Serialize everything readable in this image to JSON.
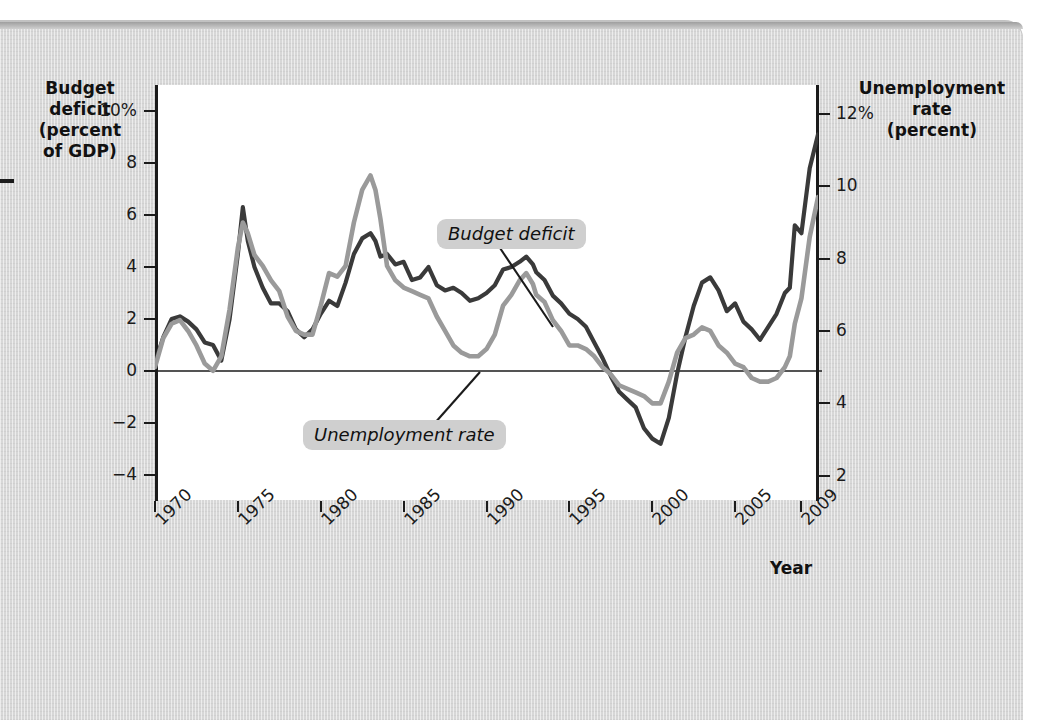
{
  "figure": {
    "background_color": "#d7d7d7",
    "plot_background": "#ffffff"
  },
  "axes": {
    "left_title": "Budget deficit (percent of GDP)",
    "left_title_lines": [
      "Budget",
      "deficit",
      "(percent",
      "of GDP)"
    ],
    "right_title": "Unemployment rate (percent)",
    "right_title_lines": [
      "Unemployment",
      "rate",
      "(percent)"
    ],
    "x_title": "Year",
    "left_ticks": [
      "10%",
      "8",
      "6",
      "4",
      "2",
      "0",
      "−2",
      "−4"
    ],
    "left_tick_values": [
      10,
      8,
      6,
      4,
      2,
      0,
      -2,
      -4
    ],
    "right_ticks": [
      "12%",
      "10",
      "8",
      "6",
      "4",
      "2"
    ],
    "right_tick_values": [
      12,
      10,
      8,
      6,
      4,
      2
    ],
    "x_ticks": [
      "1970",
      "1975",
      "1980",
      "1985",
      "1990",
      "1995",
      "2000",
      "2005",
      "2009"
    ],
    "x_tick_values": [
      1970,
      1975,
      1980,
      1985,
      1990,
      1995,
      2000,
      2005,
      2009
    ]
  },
  "callouts": {
    "budget_deficit": "Budget deficit",
    "unemployment_rate": "Unemployment rate"
  },
  "chart_data": {
    "type": "line",
    "title": "",
    "xlabel": "Year",
    "grid": false,
    "legend": "annotated-callouts",
    "xlim": [
      1970,
      2010
    ],
    "axes": [
      {
        "name": "left",
        "label": "Budget deficit (percent of GDP)",
        "ylim": [
          -5,
          11
        ],
        "ticks": [
          -4,
          -2,
          0,
          2,
          4,
          6,
          8,
          10
        ]
      },
      {
        "name": "right",
        "label": "Unemployment rate (percent)",
        "ylim": [
          1.3,
          12.8
        ],
        "ticks": [
          2,
          4,
          6,
          8,
          10,
          12
        ]
      }
    ],
    "zero_line": 0,
    "series": [
      {
        "name": "Budget deficit",
        "axis": "left",
        "color": "#3a3a3a",
        "units": "percent of GDP",
        "x": [
          1970.0,
          1970.5,
          1971.0,
          1971.5,
          1972.0,
          1972.5,
          1973.0,
          1973.5,
          1974.0,
          1974.5,
          1975.0,
          1975.3,
          1975.6,
          1976.0,
          1976.5,
          1977.0,
          1977.5,
          1978.0,
          1978.5,
          1979.0,
          1979.5,
          1980.0,
          1980.5,
          1981.0,
          1981.5,
          1982.0,
          1982.5,
          1983.0,
          1983.3,
          1983.6,
          1984.0,
          1984.5,
          1985.0,
          1985.5,
          1986.0,
          1986.5,
          1987.0,
          1987.5,
          1988.0,
          1988.5,
          1989.0,
          1989.5,
          1990.0,
          1990.5,
          1991.0,
          1991.5,
          1992.0,
          1992.4,
          1992.8,
          1993.0,
          1993.5,
          1994.0,
          1994.5,
          1995.0,
          1995.5,
          1996.0,
          1996.5,
          1997.0,
          1997.5,
          1998.0,
          1998.5,
          1999.0,
          1999.5,
          2000.0,
          2000.5,
          2001.0,
          2001.5,
          2002.0,
          2002.5,
          2003.0,
          2003.5,
          2004.0,
          2004.5,
          2005.0,
          2005.5,
          2006.0,
          2006.5,
          2007.0,
          2007.5,
          2008.0,
          2008.3,
          2008.6,
          2009.0,
          2009.5,
          2010.0
        ],
        "y": [
          0.3,
          1.3,
          2.0,
          2.1,
          1.9,
          1.6,
          1.1,
          1.0,
          0.4,
          2.0,
          4.5,
          6.3,
          5.0,
          4.0,
          3.2,
          2.6,
          2.6,
          2.3,
          1.6,
          1.3,
          1.6,
          2.2,
          2.7,
          2.5,
          3.4,
          4.5,
          5.1,
          5.3,
          5.0,
          4.4,
          4.5,
          4.1,
          4.2,
          3.5,
          3.6,
          4.0,
          3.3,
          3.1,
          3.2,
          3.0,
          2.7,
          2.8,
          3.0,
          3.3,
          3.9,
          4.0,
          4.2,
          4.4,
          4.1,
          3.8,
          3.5,
          2.9,
          2.6,
          2.2,
          2.0,
          1.7,
          1.1,
          0.5,
          -0.2,
          -0.8,
          -1.1,
          -1.4,
          -2.2,
          -2.6,
          -2.8,
          -1.8,
          -0.1,
          1.3,
          2.5,
          3.4,
          3.6,
          3.1,
          2.3,
          2.6,
          1.9,
          1.6,
          1.2,
          1.7,
          2.2,
          3.0,
          3.2,
          5.6,
          5.3,
          7.8,
          9.1
        ]
      },
      {
        "name": "Unemployment rate",
        "axis": "right",
        "color": "#9a9a9a",
        "units": "percent",
        "x": [
          1970.0,
          1970.5,
          1971.0,
          1971.5,
          1972.0,
          1972.5,
          1973.0,
          1973.5,
          1974.0,
          1974.5,
          1975.0,
          1975.3,
          1975.6,
          1976.0,
          1976.5,
          1977.0,
          1977.5,
          1978.0,
          1978.5,
          1979.0,
          1979.5,
          1980.0,
          1980.5,
          1981.0,
          1981.5,
          1982.0,
          1982.5,
          1983.0,
          1983.3,
          1983.6,
          1984.0,
          1984.5,
          1985.0,
          1985.5,
          1986.0,
          1986.5,
          1987.0,
          1987.5,
          1988.0,
          1988.5,
          1989.0,
          1989.5,
          1990.0,
          1990.5,
          1991.0,
          1991.5,
          1992.0,
          1992.4,
          1992.8,
          1993.0,
          1993.5,
          1994.0,
          1994.5,
          1995.0,
          1995.5,
          1996.0,
          1996.5,
          1997.0,
          1997.5,
          1998.0,
          1998.5,
          1999.0,
          1999.5,
          2000.0,
          2000.5,
          2001.0,
          2001.5,
          2002.0,
          2002.5,
          2003.0,
          2003.5,
          2004.0,
          2004.5,
          2005.0,
          2005.5,
          2006.0,
          2006.5,
          2007.0,
          2007.5,
          2008.0,
          2008.3,
          2008.6,
          2009.0,
          2009.5,
          2010.0
        ],
        "y": [
          5.0,
          5.8,
          6.2,
          6.3,
          6.0,
          5.6,
          5.1,
          4.9,
          5.3,
          6.6,
          8.3,
          9.0,
          8.7,
          8.1,
          7.8,
          7.4,
          7.1,
          6.4,
          6.0,
          5.9,
          5.9,
          6.7,
          7.6,
          7.5,
          7.8,
          9.0,
          9.9,
          10.3,
          9.9,
          9.1,
          7.8,
          7.4,
          7.2,
          7.1,
          7.0,
          6.9,
          6.4,
          6.0,
          5.6,
          5.4,
          5.3,
          5.3,
          5.5,
          5.9,
          6.7,
          7.0,
          7.4,
          7.6,
          7.3,
          7.0,
          6.8,
          6.3,
          6.0,
          5.6,
          5.6,
          5.5,
          5.3,
          5.0,
          4.8,
          4.5,
          4.4,
          4.3,
          4.2,
          4.0,
          4.0,
          4.6,
          5.4,
          5.8,
          5.9,
          6.1,
          6.0,
          5.6,
          5.4,
          5.1,
          5.0,
          4.7,
          4.6,
          4.6,
          4.7,
          5.0,
          5.3,
          6.2,
          6.9,
          8.6,
          9.7
        ]
      }
    ]
  }
}
